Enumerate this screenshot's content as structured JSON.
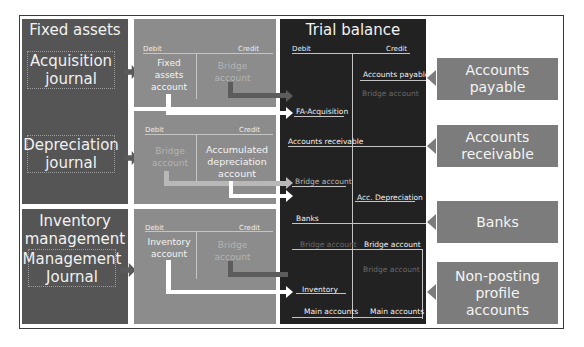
{
  "panels": {
    "fixed_assets": {
      "title": "Fixed assets",
      "acquisition_journal": [
        "Acquisition",
        "journal"
      ],
      "depreciation_journal": [
        "Depreciation",
        "journal"
      ]
    },
    "inventory_management": {
      "title": [
        "Inventory",
        "management"
      ],
      "management_journal": [
        "Management",
        "Journal"
      ]
    }
  },
  "t_accounts": {
    "acquisition": {
      "debit_label": "Debit",
      "credit_label": "Credit",
      "debit_account": [
        "Fixed",
        "assets",
        "account"
      ],
      "credit_account": [
        "Bridge",
        "account"
      ]
    },
    "depreciation": {
      "debit_label": "Debit",
      "credit_label": "Credit",
      "debit_account": [
        "Bridge",
        "account"
      ],
      "credit_account": [
        "Accumulated",
        "depreciation",
        "account"
      ]
    },
    "inventory": {
      "debit_label": "Debit",
      "credit_label": "Credit",
      "debit_account": [
        "Inventory",
        "account"
      ],
      "credit_account": [
        "Bridge",
        "account"
      ]
    }
  },
  "trial_balance": {
    "title": "Trial balance",
    "debit_label": "Debit",
    "credit_label": "Credit",
    "entries": {
      "accounts_payable": "Accounts payable",
      "bridge_faint_1": "Bridge account",
      "fa_acquisition": "FA-Acquisition",
      "accounts_receivable": "Accounts receivable",
      "bridge_account": "Bridge account",
      "acc_depreciation": "Acc. Depreciation",
      "banks": "Banks",
      "bridge_faint_debit": "Bridge account",
      "bridge_credit": "Bridge account",
      "bridge_faint_2": "Bridge account",
      "inventory": "Inventory",
      "main_accounts_debit": "Main accounts",
      "main_accounts_credit": "Main accounts"
    }
  },
  "external": {
    "accounts_payable": "Accounts payable",
    "accounts_receivable": "Accounts receivable",
    "banks": "Banks",
    "non_posting": [
      "Non-posting profile",
      "accounts"
    ]
  },
  "colors": {
    "dark_panel": "#555555",
    "mid_panel": "#8c8c8c",
    "trial_balance": "#222222",
    "external_box": "#7c7c7c",
    "pipe_white": "#ffffff",
    "pipe_dark": "#5c5c5c"
  }
}
